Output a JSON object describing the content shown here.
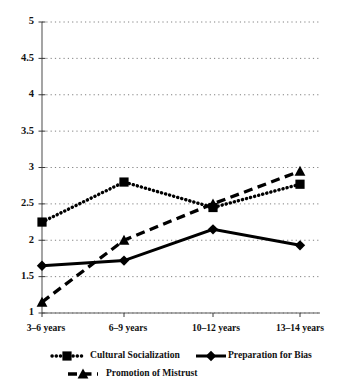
{
  "chart_data": {
    "type": "line",
    "title": "",
    "xlabel": "",
    "ylabel": "",
    "categories": [
      "3–6 years",
      "6–9 years",
      "10–12 years",
      "13–14 years"
    ],
    "ylim": [
      1,
      5
    ],
    "ytick_values": [
      1,
      1.5,
      2,
      2.5,
      3,
      3.5,
      4,
      4.5,
      5
    ],
    "ytick_labels": [
      "1",
      "1.5",
      "2",
      "2.5",
      "3",
      "3.5",
      "4",
      "4.5",
      "5"
    ],
    "grid": true,
    "grid_axis": "y",
    "legend_position": "bottom",
    "series": [
      {
        "name": "Cultural Socialization",
        "values": [
          2.25,
          2.8,
          2.45,
          2.77
        ],
        "line_style": "dotted",
        "marker": "square",
        "color": "#000000"
      },
      {
        "name": "Preparation for Bias",
        "values": [
          1.65,
          1.72,
          2.15,
          1.93
        ],
        "line_style": "solid",
        "marker": "diamond",
        "color": "#000000"
      },
      {
        "name": "Promotion of Mistrust",
        "values": [
          1.15,
          2.0,
          2.5,
          2.95
        ],
        "line_style": "dashed",
        "marker": "triangle",
        "color": "#000000"
      }
    ]
  },
  "legend": {
    "items": [
      {
        "label": "Cultural Socialization"
      },
      {
        "label": "Preparation for Bias"
      },
      {
        "label": "Promotion of Mistrust"
      }
    ]
  }
}
